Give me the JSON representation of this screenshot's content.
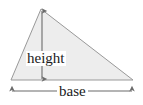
{
  "figure": {
    "name": "triangle-area-diagram",
    "background_color": "#ffffff"
  },
  "shape": {
    "kind": "triangle",
    "fill_color": "#ededed",
    "stroke_color": "#999999",
    "stroke_width": 1,
    "vertices": [
      {
        "name": "apex",
        "x": 41,
        "y": 9
      },
      {
        "name": "bottom-right",
        "x": 133,
        "y": 80
      },
      {
        "name": "bottom-left",
        "x": 11,
        "y": 80
      }
    ]
  },
  "dimensions": {
    "height": {
      "label": "height",
      "orientation": "vertical",
      "arrow_color": "#6b6b6b",
      "arrowheads": "both",
      "from": {
        "x": 42,
        "y": 10
      },
      "to": {
        "x": 42,
        "y": 80
      }
    },
    "base": {
      "label": "base",
      "orientation": "horizontal",
      "arrow_color": "#6b6b6b",
      "arrowheads": "both",
      "from": {
        "x": 11,
        "y": 91
      },
      "to": {
        "x": 133,
        "y": 91
      }
    }
  }
}
